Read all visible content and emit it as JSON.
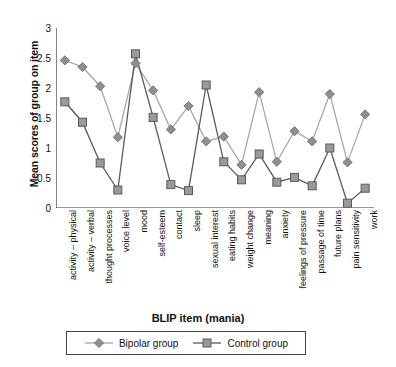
{
  "chart_data": {
    "type": "line",
    "title": "",
    "xlabel": "BLIP item (mania)",
    "ylabel": "Mean scores of group on item",
    "ylim": [
      0,
      3
    ],
    "yticks": [
      "0",
      "0.5",
      "1",
      "1.5",
      "2",
      "2.5",
      "3"
    ],
    "grid": false,
    "legend_position": "bottom",
    "categories": [
      "activity – physical",
      "activity – verbal",
      "thought processes",
      "voice level",
      "mood",
      "self-esteem",
      "contact",
      "sleep",
      "sexual interest",
      "eating habits",
      "weight change",
      "meaning",
      "anxiety",
      "feelings of pressure",
      "passage of time",
      "future plans",
      "pain sensitivity",
      "work"
    ],
    "series": [
      {
        "name": "Bipolar group",
        "marker": "diamond",
        "color": "#8f8f8f",
        "line_color": "#a8a8a8",
        "values": [
          2.46,
          2.35,
          2.03,
          1.18,
          2.41,
          1.96,
          1.31,
          1.7,
          1.11,
          1.19,
          0.72,
          1.93,
          0.77,
          1.28,
          1.11,
          1.9,
          0.76,
          1.56
        ]
      },
      {
        "name": "Control group",
        "marker": "square",
        "color": "#9a9a9a",
        "line_color": "#5a5a5a",
        "values": [
          1.77,
          1.43,
          0.75,
          0.3,
          2.57,
          1.51,
          0.39,
          0.29,
          2.05,
          0.77,
          0.47,
          0.9,
          0.43,
          0.51,
          0.37,
          1.0,
          0.08,
          0.33
        ]
      }
    ]
  },
  "legend": {
    "items": [
      {
        "label": "Bipolar group"
      },
      {
        "label": "Control group"
      }
    ]
  },
  "axis": {
    "x_title": "BLIP item (mania)",
    "y_title": "Mean scores of group on item"
  }
}
